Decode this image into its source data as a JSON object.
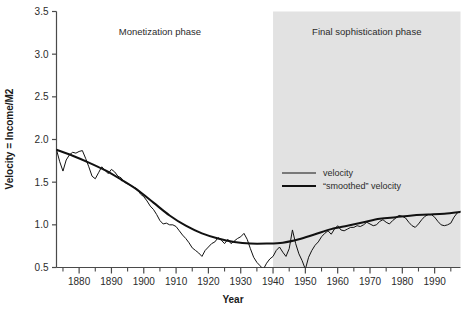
{
  "chart_data": {
    "type": "line",
    "title": "",
    "xlabel": "Year",
    "ylabel": "Velocity = Income/M2",
    "xlim": [
      1873,
      1998
    ],
    "ylim": [
      0.5,
      3.5
    ],
    "grid": false,
    "legend_position": "center-right",
    "x_major_ticks": [
      1880,
      1890,
      1900,
      1910,
      1920,
      1930,
      1940,
      1950,
      1960,
      1970,
      1980,
      1990
    ],
    "x_major_tick_labels": [
      "1880",
      "1890",
      "1900",
      "1910",
      "1920",
      "1930",
      "1940",
      "1950",
      "1960",
      "1970",
      "1980",
      "1990"
    ],
    "x_minor_tick_step": 5,
    "y_ticks": [
      0.5,
      1.0,
      1.5,
      2.0,
      2.5,
      3.0,
      3.5
    ],
    "y_tick_labels": [
      "0.5",
      "1.0",
      "1.5",
      "2.0",
      "2.5",
      "3.0",
      "3.5"
    ],
    "annotations": [
      {
        "name": "monetization-phase",
        "text": "Monetization phase",
        "x": 1905,
        "y": 3.22
      },
      {
        "name": "final-sophistication-phase",
        "text": "Final sophistication phase",
        "x": 1969,
        "y": 3.22
      }
    ],
    "shaded_region": {
      "label": "Final sophistication phase",
      "x_start": 1940,
      "x_end": 1998,
      "color": "#e2e2e2"
    },
    "series": [
      {
        "name": "velocity",
        "legend_label": "velocity",
        "line_width": 1,
        "color": "#111111",
        "x": [
          1873,
          1874,
          1875,
          1876,
          1877,
          1878,
          1879,
          1880,
          1881,
          1882,
          1883,
          1884,
          1885,
          1886,
          1887,
          1888,
          1889,
          1890,
          1891,
          1892,
          1893,
          1894,
          1895,
          1896,
          1897,
          1898,
          1899,
          1900,
          1901,
          1902,
          1903,
          1904,
          1905,
          1906,
          1907,
          1908,
          1909,
          1910,
          1911,
          1912,
          1913,
          1914,
          1915,
          1916,
          1917,
          1918,
          1919,
          1920,
          1921,
          1922,
          1923,
          1924,
          1925,
          1926,
          1927,
          1928,
          1929,
          1930,
          1931,
          1932,
          1933,
          1934,
          1935,
          1936,
          1937,
          1938,
          1939,
          1940,
          1941,
          1942,
          1943,
          1944,
          1945,
          1946,
          1947,
          1948,
          1949,
          1950,
          1951,
          1952,
          1953,
          1954,
          1955,
          1956,
          1957,
          1958,
          1959,
          1960,
          1961,
          1962,
          1963,
          1964,
          1965,
          1966,
          1967,
          1968,
          1969,
          1970,
          1971,
          1972,
          1973,
          1974,
          1975,
          1976,
          1977,
          1978,
          1979,
          1980,
          1981,
          1982,
          1983,
          1984,
          1985,
          1986,
          1987,
          1988,
          1989,
          1990,
          1991,
          1992,
          1993,
          1994,
          1995,
          1996,
          1997,
          1998
        ],
        "y": [
          1.88,
          1.74,
          1.63,
          1.76,
          1.82,
          1.85,
          1.84,
          1.86,
          1.87,
          1.78,
          1.68,
          1.57,
          1.54,
          1.61,
          1.68,
          1.64,
          1.6,
          1.65,
          1.62,
          1.57,
          1.55,
          1.5,
          1.48,
          1.46,
          1.44,
          1.42,
          1.36,
          1.33,
          1.28,
          1.22,
          1.18,
          1.12,
          1.05,
          1.01,
          1.02,
          1.0,
          1.0,
          0.98,
          0.93,
          0.88,
          0.84,
          0.79,
          0.73,
          0.7,
          0.67,
          0.63,
          0.7,
          0.74,
          0.78,
          0.8,
          0.85,
          0.82,
          0.78,
          0.83,
          0.78,
          0.81,
          0.84,
          0.86,
          0.9,
          0.83,
          0.72,
          0.62,
          0.56,
          0.52,
          0.48,
          0.55,
          0.6,
          0.63,
          0.7,
          0.74,
          0.68,
          0.63,
          0.72,
          0.94,
          0.78,
          0.66,
          0.58,
          0.48,
          0.62,
          0.7,
          0.76,
          0.8,
          0.86,
          0.9,
          0.93,
          0.89,
          0.95,
          0.99,
          0.94,
          0.93,
          0.95,
          0.97,
          0.97,
          0.99,
          0.98,
          1.0,
          1.03,
          1.01,
          0.99,
          1.0,
          1.04,
          1.06,
          1.03,
          1.01,
          1.05,
          1.08,
          1.11,
          1.1,
          1.08,
          1.03,
          0.99,
          0.97,
          1.01,
          1.06,
          1.1,
          1.12,
          1.12,
          1.09,
          1.04,
          1.0,
          0.99,
          1.0,
          1.02,
          1.09,
          1.14,
          1.16
        ]
      },
      {
        "name": "smoothed-velocity",
        "legend_label": "“smoothed” velocity",
        "line_width": 2,
        "color": "#111111",
        "x": [
          1873,
          1878,
          1883,
          1888,
          1893,
          1898,
          1903,
          1908,
          1913,
          1918,
          1923,
          1928,
          1933,
          1938,
          1943,
          1948,
          1953,
          1958,
          1963,
          1968,
          1973,
          1978,
          1983,
          1988,
          1993,
          1998
        ],
        "y": [
          1.88,
          1.81,
          1.73,
          1.64,
          1.53,
          1.41,
          1.26,
          1.11,
          0.99,
          0.9,
          0.84,
          0.8,
          0.78,
          0.78,
          0.79,
          0.83,
          0.89,
          0.95,
          0.99,
          1.03,
          1.07,
          1.09,
          1.11,
          1.12,
          1.13,
          1.15
        ]
      }
    ]
  },
  "legend": {
    "items": [
      {
        "label": "velocity",
        "style": "thin"
      },
      {
        "label": "“smoothed” velocity",
        "style": "thick"
      }
    ]
  }
}
